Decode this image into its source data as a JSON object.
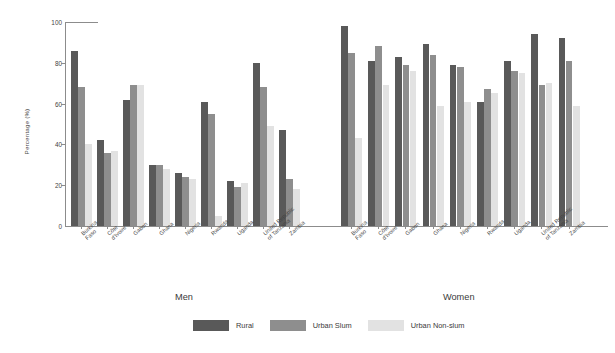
{
  "chart_data": {
    "type": "bar",
    "title": "",
    "xlabel": "",
    "ylabel": "Percentage (%)",
    "ylim": [
      0,
      100
    ],
    "yticks": [
      0,
      20,
      40,
      60,
      80,
      100
    ],
    "grid": false,
    "legend_position": "bottom-center",
    "legend": [
      "Rural",
      "Urban Slum",
      "Urban Non-slum"
    ],
    "colors": {
      "rural": "#595959",
      "urban_slum": "#8e8e8e",
      "urban_nonslum": "#e2e2e2"
    },
    "panels": [
      {
        "name": "Men",
        "categories": [
          "Burkina Faso",
          "Côte d'Ivoire",
          "Gabon",
          "Ghana",
          "Nigeria",
          "Rwanda",
          "Uganda",
          "United Republic of Tanzania",
          "Zambia"
        ],
        "series": [
          {
            "name": "Rural",
            "values": [
              86,
              42,
              62,
              30,
              26,
              61,
              22,
              80,
              47
            ]
          },
          {
            "name": "Urban Slum",
            "values": [
              68,
              36,
              69,
              30,
              24,
              55,
              19,
              68,
              23
            ]
          },
          {
            "name": "Urban Non-slum",
            "values": [
              40,
              37,
              69,
              28,
              23,
              5,
              21,
              49,
              18
            ]
          }
        ]
      },
      {
        "name": "Women",
        "categories": [
          "Burkina Faso",
          "Côte d'Ivoire",
          "Gabon",
          "Ghana",
          "Nigeria",
          "Rwanda",
          "Uganda",
          "United Republic of Tanzania",
          "Zambia"
        ],
        "series": [
          {
            "name": "Rural",
            "values": [
              98,
              81,
              83,
              89,
              79,
              61,
              81,
              94,
              92
            ]
          },
          {
            "name": "Urban Slum",
            "values": [
              85,
              88,
              79,
              84,
              78,
              67,
              76,
              69,
              81
            ]
          },
          {
            "name": "Urban Non-slum",
            "values": [
              43,
              69,
              76,
              59,
              61,
              65,
              75,
              70,
              59
            ]
          }
        ]
      }
    ]
  },
  "panel_titles": {
    "men": "Men",
    "women": "Women"
  },
  "axis": {
    "y_title": "Percentage (%)"
  }
}
